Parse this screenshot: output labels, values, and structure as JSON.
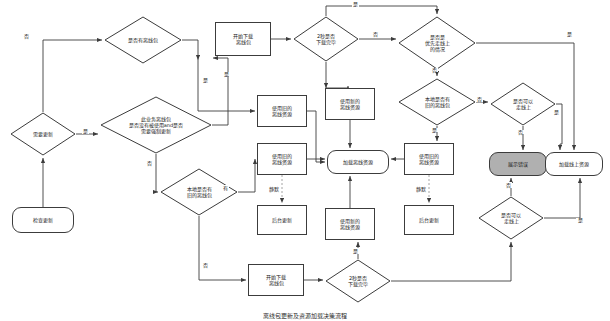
{
  "diagram": {
    "caption": "离线包更新及资源加载决策流程",
    "colors": {
      "stroke": "#3c3c3c",
      "text": "#1a1a1a",
      "background": "#ffffff",
      "error_fill": "#b0b0b0"
    },
    "nodes": [
      {
        "id": "start",
        "label": "检查更新",
        "shape": "terminator",
        "x": 12,
        "y": 207,
        "w": 62,
        "h": 26
      },
      {
        "id": "need_update",
        "label": "需要更新",
        "shape": "diamond",
        "x": 10,
        "y": 112,
        "w": 66,
        "h": 44
      },
      {
        "id": "has_pkg",
        "label": "是否有离线包",
        "shape": "diamond",
        "x": 104,
        "y": 16,
        "w": 78,
        "h": 48
      },
      {
        "id": "biz_check",
        "label": "此业务离线包\n是否没有被使用and是否\n需要强制更新",
        "shape": "diamond",
        "x": 100,
        "y": 96,
        "w": 112,
        "h": 58
      },
      {
        "id": "local_old",
        "label": "本地是否有\n旧的离线包",
        "shape": "diamond",
        "x": 160,
        "y": 168,
        "w": 78,
        "h": 48
      },
      {
        "id": "dl_top",
        "label": "开始下载\n离线包",
        "shape": "rect",
        "x": 215,
        "y": 22,
        "w": 56,
        "h": 34
      },
      {
        "id": "dl_bot",
        "label": "开始下载\n离线包",
        "shape": "rect",
        "x": 248,
        "y": 264,
        "w": 56,
        "h": 32
      },
      {
        "id": "dl_done_top",
        "label": "2秒是否\n下载完毕",
        "shape": "diamond",
        "x": 293,
        "y": 16,
        "w": 66,
        "h": 46
      },
      {
        "id": "dl_done_bot",
        "label": "2秒是否\n下载完毕",
        "shape": "diamond",
        "x": 325,
        "y": 259,
        "w": 66,
        "h": 44
      },
      {
        "id": "prefer_online",
        "label": "是否是\n优先走线上\n的情况",
        "shape": "diamond",
        "x": 398,
        "y": 16,
        "w": 78,
        "h": 54
      },
      {
        "id": "has_old_local",
        "label": "本地是否有\n旧的离线包",
        "shape": "diamond",
        "x": 398,
        "y": 78,
        "w": 78,
        "h": 48
      },
      {
        "id": "can_online_1",
        "label": "是否可以\n走线上",
        "shape": "diamond",
        "x": 490,
        "y": 82,
        "w": 66,
        "h": 44
      },
      {
        "id": "can_online_2",
        "label": "是否可以\n走线上",
        "shape": "diamond",
        "x": 478,
        "y": 196,
        "w": 66,
        "h": 44
      },
      {
        "id": "use_old_1",
        "label": "使用旧的\n离线资源",
        "shape": "rect",
        "x": 257,
        "y": 95,
        "w": 50,
        "h": 32
      },
      {
        "id": "use_old_2",
        "label": "使用旧的\n离线资源",
        "shape": "rect",
        "x": 257,
        "y": 143,
        "w": 50,
        "h": 32
      },
      {
        "id": "use_new_1",
        "label": "使用新的\n离线资源",
        "shape": "rect",
        "x": 325,
        "y": 88,
        "w": 50,
        "h": 32
      },
      {
        "id": "use_new_2",
        "label": "使用新的\n离线资源",
        "shape": "rect",
        "x": 325,
        "y": 208,
        "w": 50,
        "h": 32
      },
      {
        "id": "use_old_3",
        "label": "使用旧的\n离线资源",
        "shape": "rect",
        "x": 404,
        "y": 143,
        "w": 50,
        "h": 32
      },
      {
        "id": "bg_update_1",
        "label": "后台更新",
        "shape": "rect",
        "x": 257,
        "y": 205,
        "w": 50,
        "h": 30
      },
      {
        "id": "bg_update_2",
        "label": "后台更新",
        "shape": "rect",
        "x": 404,
        "y": 205,
        "w": 50,
        "h": 30
      },
      {
        "id": "load_offline",
        "label": "加载离线资源",
        "shape": "terminator",
        "x": 327,
        "y": 150,
        "w": 62,
        "h": 24
      },
      {
        "id": "show_error",
        "label": "展示错误",
        "shape": "terminator",
        "x": 489,
        "y": 152,
        "w": 58,
        "h": 24,
        "fill": "error"
      },
      {
        "id": "load_online",
        "label": "加载线上资源",
        "shape": "terminator",
        "x": 545,
        "y": 152,
        "w": 58,
        "h": 24
      }
    ],
    "edge_labels": [
      {
        "id": "l-need-no",
        "text": "否",
        "x": 23,
        "y": 36,
        "vertical": false
      },
      {
        "id": "l-need-yes",
        "text": "是",
        "x": 82,
        "y": 128,
        "vertical": false
      },
      {
        "id": "l-haspkg-yes",
        "text": "是",
        "x": 205,
        "y": 80,
        "vertical": true
      },
      {
        "id": "l-biz-yes",
        "text": "是",
        "x": 224,
        "y": 75,
        "vertical": true
      },
      {
        "id": "l-biz-no",
        "text": "否",
        "x": 108,
        "y": 180,
        "vertical": false
      },
      {
        "id": "l-local-yes",
        "text": "有",
        "x": 223,
        "y": 187,
        "vertical": false
      },
      {
        "id": "l-local-no",
        "text": "否",
        "x": 202,
        "y": 262,
        "vertical": false
      },
      {
        "id": "l-dltop-no",
        "text": "否",
        "x": 370,
        "y": 33,
        "vertical": false
      },
      {
        "id": "l-dltop-yes",
        "text": "是",
        "x": 352,
        "y": 8,
        "vertical": false
      },
      {
        "id": "l-prefer-yes",
        "text": "是",
        "x": 568,
        "y": 33,
        "vertical": false
      },
      {
        "id": "l-prefer-no",
        "text": "否",
        "x": 432,
        "y": 72,
        "vertical": true
      },
      {
        "id": "l-hasold-no",
        "text": "否",
        "x": 470,
        "y": 100,
        "vertical": false
      },
      {
        "id": "l-hasold-yes",
        "text": "是",
        "x": 432,
        "y": 134,
        "vertical": true
      },
      {
        "id": "l-can1-no",
        "text": "否",
        "x": 516,
        "y": 136,
        "vertical": true
      },
      {
        "id": "l-can1-yes",
        "text": "是",
        "x": 548,
        "y": 110,
        "vertical": true
      },
      {
        "id": "l-can2-no",
        "text": "否",
        "x": 508,
        "y": 186,
        "vertical": false
      },
      {
        "id": "l-can2-yes",
        "text": "是",
        "x": 582,
        "y": 222,
        "vertical": true
      },
      {
        "id": "l-dlbot-yes",
        "text": "是",
        "x": 352,
        "y": 251,
        "vertical": false
      },
      {
        "id": "l-silent-1",
        "text": "静默",
        "x": 270,
        "y": 189,
        "vertical": false
      },
      {
        "id": "l-silent-2",
        "text": "静默",
        "x": 417,
        "y": 189,
        "vertical": false
      }
    ]
  }
}
